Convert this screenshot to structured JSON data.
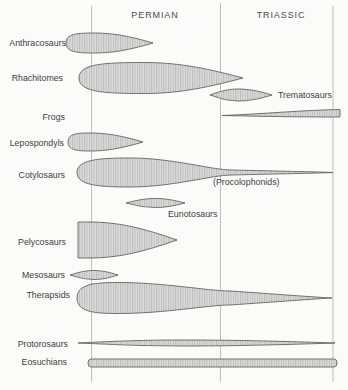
{
  "diagram": {
    "background": "#fbfbf9",
    "colors": {
      "outline": "#646464",
      "fill_light": "#dcdcdc",
      "fill_stripe": "#bcbcbc",
      "gridline": "#bdbdbd",
      "text": "#404040"
    }
  },
  "periods": [
    {
      "label": "PERMIAN",
      "x": 155,
      "y": 18
    },
    {
      "label": "TRIASSIC",
      "x": 281,
      "y": 18
    }
  ],
  "timelines": [
    {
      "x": 91.5,
      "y1": 6,
      "y2": 382
    },
    {
      "x": 220.5,
      "y1": 3,
      "y2": 382
    },
    {
      "x": 333,
      "y1": 6,
      "y2": 382
    }
  ],
  "taxa": [
    {
      "id": "anthracosaurs",
      "label": "Anthracosaurs",
      "label_x": 66,
      "label_y": 46,
      "label_anchor": "end",
      "shape": {
        "type": "lens",
        "x0": 66,
        "x1": 153,
        "cy": 43,
        "h": 20,
        "peak": 0.33,
        "left": "blunt",
        "right": "point"
      }
    },
    {
      "id": "rhachitomes",
      "label": "Rhachitomes",
      "label_x": 63,
      "label_y": 81,
      "label_anchor": "end",
      "shape": {
        "type": "lens",
        "x0": 79,
        "x1": 243,
        "cy": 78,
        "h": 31,
        "peak": 0.4,
        "left": "blunt",
        "right": "point"
      }
    },
    {
      "id": "trematosaurs",
      "label": "Trematosaurs",
      "label_x": 278,
      "label_y": 98,
      "label_anchor": "start",
      "shape": {
        "type": "lens",
        "x0": 210,
        "x1": 272,
        "cy": 95,
        "h": 12,
        "peak": 0.45,
        "left": "point",
        "right": "point"
      }
    },
    {
      "id": "frogs",
      "label": "Frogs",
      "label_x": 65,
      "label_y": 120,
      "label_anchor": "end",
      "shape": {
        "type": "wedge",
        "x0": 222,
        "x1": 340,
        "tip_y": 115.5,
        "top_y": 109.5,
        "bot_y": 117
      }
    },
    {
      "id": "lepospondyls",
      "label": "Lepospondyls",
      "label_x": 64,
      "label_y": 146,
      "label_anchor": "end",
      "shape": {
        "type": "lens",
        "x0": 68,
        "x1": 143,
        "cy": 142,
        "h": 18,
        "peak": 0.3,
        "left": "blunt",
        "right": "point"
      }
    },
    {
      "id": "cotylosaurs",
      "label": "Cotylosaurs",
      "label_x": 65,
      "label_y": 178,
      "label_anchor": "end",
      "annotation": {
        "label": "(Procolophonids)",
        "x": 213,
        "y": 185
      },
      "shape": {
        "type": "tail",
        "x0": 77,
        "xp": 130,
        "xn": 232,
        "hn": 5,
        "x1": 333,
        "cy": 172.5,
        "h": 29
      }
    },
    {
      "id": "eunotosaurs",
      "label": "Eunotosaurs",
      "label_x": 168,
      "label_y": 217,
      "label_anchor": "start",
      "shape": {
        "type": "lens",
        "x0": 126,
        "x1": 185,
        "cy": 203,
        "h": 9,
        "peak": 0.5,
        "left": "point",
        "right": "point"
      }
    },
    {
      "id": "pelycosaurs",
      "label": "Pelycosaurs",
      "label_x": 66,
      "label_y": 245,
      "label_anchor": "end",
      "shape": {
        "type": "lens",
        "x0": 78,
        "x1": 177,
        "cy": 240,
        "h": 36,
        "peak": 0.12,
        "left": "flat",
        "right": "point"
      }
    },
    {
      "id": "mesosaurs",
      "label": "Mesosaurs",
      "label_x": 65,
      "label_y": 278,
      "label_anchor": "end",
      "shape": {
        "type": "lens",
        "x0": 70,
        "x1": 118,
        "cy": 275,
        "h": 9,
        "peak": 0.5,
        "left": "point",
        "right": "point"
      }
    },
    {
      "id": "therapsids",
      "label": "Therapsids",
      "label_x": 70,
      "label_y": 298,
      "label_anchor": "end",
      "shape": {
        "type": "tail",
        "x0": 77,
        "xp": 118,
        "xn": 230,
        "hn": 14,
        "x1": 332,
        "cy": 298,
        "h": 31
      }
    },
    {
      "id": "protorosaurs",
      "label": "Protorosaurs",
      "label_x": 68,
      "label_y": 347,
      "label_anchor": "end",
      "shape": {
        "type": "lens",
        "x0": 78,
        "x1": 335,
        "cy": 343,
        "h": 6,
        "peak": 0.4,
        "left": "point",
        "right": "point"
      }
    },
    {
      "id": "eosuchians",
      "label": "Eosuchians",
      "label_x": 67,
      "label_y": 365,
      "label_anchor": "end",
      "shape": {
        "type": "band",
        "x0": 88,
        "x1": 337,
        "cy": 363,
        "h": 8,
        "r": 3
      }
    }
  ]
}
